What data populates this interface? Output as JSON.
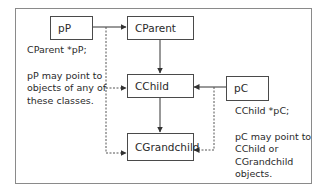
{
  "diagram": {
    "boxes": {
      "pP": "pP",
      "cparent": "CParent",
      "cchild": "CChild",
      "cgrandchild": "CGrandchild",
      "pC": "pC"
    },
    "left_note": {
      "declaration": "CParent *pP;",
      "lines": [
        "pP may point to",
        "objects of any of",
        "these classes."
      ]
    },
    "right_note": {
      "declaration": "CChild *pC;",
      "lines": [
        "pC may point to",
        "CChild or",
        "CGrandchild",
        "objects."
      ]
    },
    "edges": [
      {
        "from": "pP",
        "to": "CParent",
        "style": "solid"
      },
      {
        "from": "pP",
        "to": "CChild",
        "style": "dashed"
      },
      {
        "from": "pP",
        "to": "CGrandchild",
        "style": "dashed"
      },
      {
        "from": "CParent",
        "to": "CChild",
        "style": "solid"
      },
      {
        "from": "CChild",
        "to": "CGrandchild",
        "style": "solid"
      },
      {
        "from": "pC",
        "to": "CChild",
        "style": "solid"
      },
      {
        "from": "pC",
        "to": "CGrandchild",
        "style": "dashed"
      }
    ]
  }
}
